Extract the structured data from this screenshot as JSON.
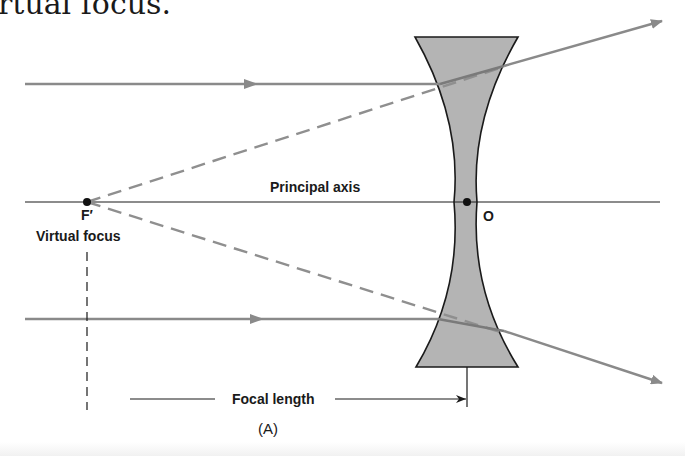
{
  "heading_fragment": "rtual focus.",
  "diagram": {
    "labels": {
      "principal_axis": "Principal axis",
      "focal_point": "F′",
      "virtual_focus": "Virtual focus",
      "optical_center": "O",
      "focal_length": "Focal length",
      "figure_caption": "(A)"
    },
    "colors": {
      "ray": "#8a8a8a",
      "dashed_extension": "#8f8f8f",
      "lens_fill": "#b4b4b4",
      "lens_outline": "#1a1a1a",
      "axis": "#1a1a1a",
      "text": "#1a1a1a"
    },
    "elements": {
      "incident_rays": 2,
      "refracted_rays": 2,
      "dashed_extensions": 2,
      "lens_type": "biconcave"
    }
  }
}
